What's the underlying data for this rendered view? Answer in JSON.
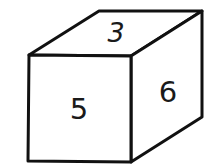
{
  "cube": {
    "faces": {
      "top": {
        "label": "3"
      },
      "front": {
        "label": "5"
      },
      "right": {
        "label": "6"
      }
    },
    "stroke_color": "#111111",
    "fill_color": "#ffffff"
  }
}
